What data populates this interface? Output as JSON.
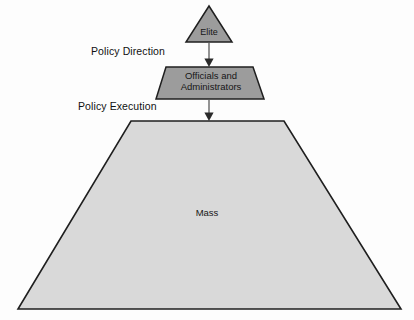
{
  "diagram": {
    "type": "hierarchy-pyramid",
    "background_color": "#fdfdfd",
    "shapes": [
      {
        "id": "elite",
        "name": "elite-triangle",
        "shape": "triangle",
        "label": "Elite",
        "fill": "#9c9c9c",
        "stroke": "#1f1f1f",
        "level": 1
      },
      {
        "id": "officials",
        "name": "officials-trapezoid",
        "shape": "trapezoid",
        "label": "Officials and\nAdministrators",
        "label_line1": "Officials and",
        "label_line2": "Administrators",
        "fill": "#9c9c9c",
        "stroke": "#1f1f1f",
        "level": 2
      },
      {
        "id": "mass",
        "name": "mass-trapezoid",
        "shape": "trapezoid",
        "label": "Mass",
        "fill": "#d9d9d9",
        "stroke": "#1f1f1f",
        "level": 3
      }
    ],
    "connectors": [
      {
        "id": "arrow-1",
        "name": "policy-direction-arrow",
        "from": "elite",
        "to": "officials",
        "label": "Policy Direction",
        "color": "#808080"
      },
      {
        "id": "arrow-2",
        "name": "policy-execution-arrow",
        "from": "officials",
        "to": "mass",
        "label": "Policy Execution",
        "color": "#808080"
      }
    ],
    "labels": {
      "elite": "Elite",
      "officials_line1": "Officials and",
      "officials_line2": "Administrators",
      "mass": "Mass",
      "policy_direction": "Policy Direction",
      "policy_execution": "Policy Execution"
    },
    "colors": {
      "dark_fill": "#9c9c9c",
      "light_fill": "#d9d9d9",
      "stroke": "#1f1f1f",
      "arrow": "#808080",
      "text": "#161616"
    }
  }
}
